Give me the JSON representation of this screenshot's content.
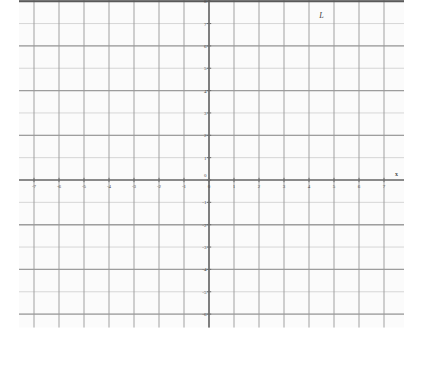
{
  "figure": {
    "title": "",
    "background_color": "#fbfbfb",
    "grid_color": "#9a9a9a",
    "axis_color": "#6b6b6b",
    "line_color": "#5a5a5a"
  },
  "axes": {
    "x_axis_name": "x",
    "y_axis_name": "y",
    "x_tick_labels": [
      "-7",
      "-6",
      "-5",
      "-4",
      "-3",
      "-2",
      "-1",
      "0",
      "1",
      "2",
      "3",
      "4",
      "5",
      "6",
      "7"
    ],
    "y_tick_labels": [
      "-6",
      "-5",
      "-4",
      "-3",
      "-2",
      "-1",
      "0",
      "1",
      "2",
      "3",
      "4",
      "5",
      "6",
      "7",
      "8"
    ]
  },
  "annotations": {
    "line_label": "L"
  },
  "chart_data": {
    "type": "line",
    "title": "",
    "xlabel": "x",
    "ylabel": "y",
    "grid": true,
    "legend": "none",
    "xlim": [
      -7.6,
      7.8
    ],
    "ylim": [
      -6.6,
      8.6
    ],
    "xticks": [
      -7,
      -6,
      -5,
      -4,
      -3,
      -2,
      -1,
      0,
      1,
      2,
      3,
      4,
      5,
      6,
      7
    ],
    "yticks": [
      -6,
      -5,
      -4,
      -3,
      -2,
      -1,
      0,
      1,
      2,
      3,
      4,
      5,
      6,
      7,
      8
    ],
    "grid_major_x_step": 1,
    "grid_major_y_step": 1,
    "grid_heavy_x_step": 1,
    "grid_heavy_y_step": 2,
    "series": [
      {
        "name": "L",
        "type": "line",
        "equation": "y = 8",
        "slope": 0,
        "intercept": 8,
        "x": [
          -7.6,
          7.8
        ],
        "values": [
          8,
          8
        ],
        "label": "L",
        "label_x": 4.5,
        "label_y": 7.55
      }
    ]
  }
}
